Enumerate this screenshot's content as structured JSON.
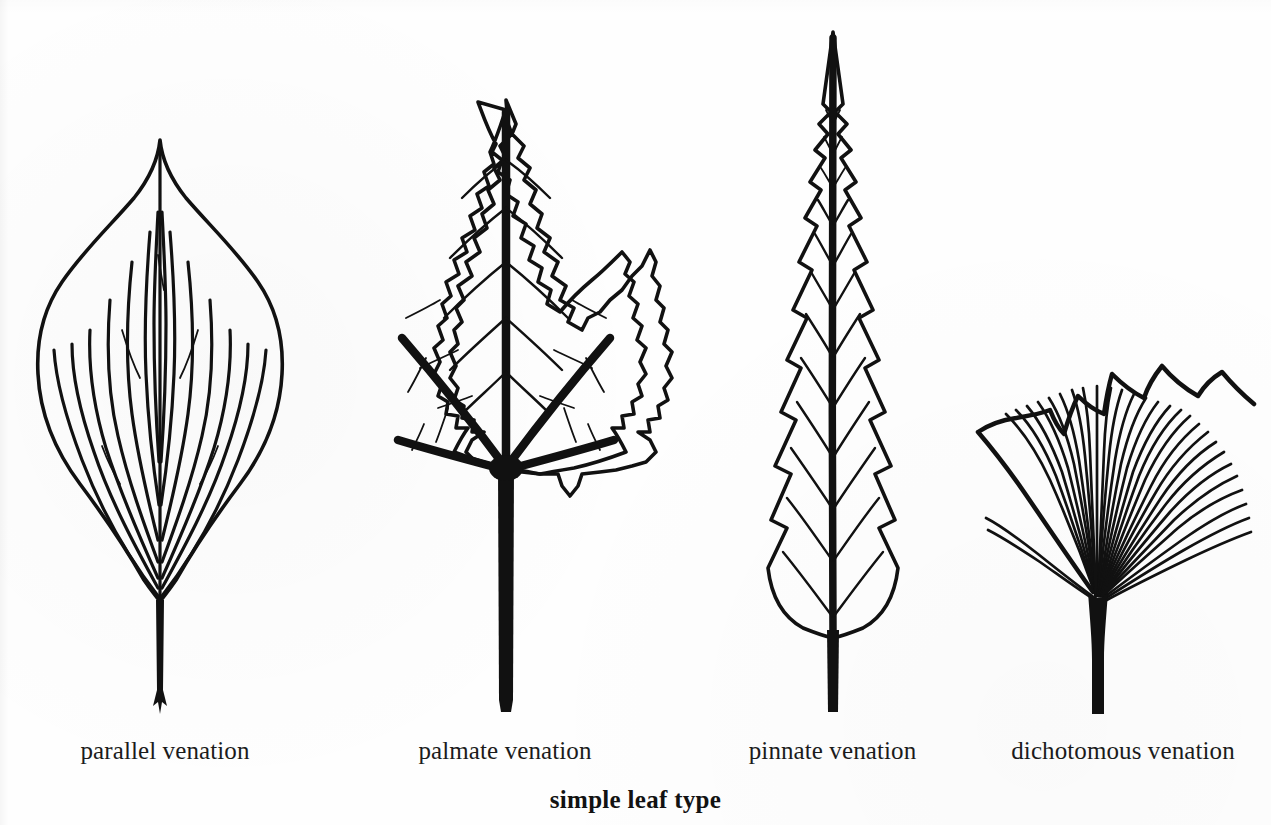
{
  "figure": {
    "caption": "simple leaf type",
    "background_color": "#fefefe",
    "ink_color": "#111111",
    "panel_count": 4
  },
  "panels": [
    {
      "id": "parallel",
      "label": "parallel venation",
      "venation_type": "parallel",
      "leaf_shape": "ovate with acuminate apex",
      "margin": "entire",
      "vein_count": 14,
      "petiole": "slender, flared at base"
    },
    {
      "id": "palmate",
      "label": "palmate venation",
      "venation_type": "palmate",
      "leaf_shape": "three-lobed maple-like",
      "margin": "doubly serrate",
      "vein_count": 5,
      "petiole": "thick, straight"
    },
    {
      "id": "pinnate",
      "label": "pinnate venation",
      "venation_type": "pinnate",
      "leaf_shape": "narrow lanceolate",
      "margin": "coarsely toothed",
      "vein_count": 13,
      "petiole": "short, thick midrib extension"
    },
    {
      "id": "dichotomous",
      "label": "dichotomous venation",
      "venation_type": "dichotomous",
      "leaf_shape": "fan-shaped (ginkgo)",
      "margin": "wavy, shallowly lobed",
      "vein_count": 42,
      "petiole": "thick, widening into blade"
    }
  ],
  "labels": {
    "parallel": "parallel venation",
    "palmate": "palmate venation",
    "pinnate": "pinnate venation",
    "dichotomous": "dichotomous venation"
  }
}
